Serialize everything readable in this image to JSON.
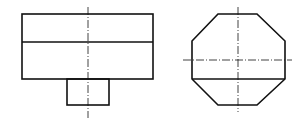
{
  "drawing": {
    "type": "orthographic projection",
    "views": [
      {
        "name": "front-view",
        "outer_rect": {
          "x": 22,
          "y": 14,
          "w": 131,
          "h": 65
        },
        "divider_y": 42,
        "stem_rect": {
          "x": 67,
          "y": 79,
          "w": 42,
          "h": 26
        },
        "centerline_v": {
          "x": 88,
          "y1": 7,
          "y2": 118
        }
      },
      {
        "name": "side-view",
        "octagon_points": "218,14 257,14 285,41 285,79 257,105 218,105 192,79 192,41",
        "chord": {
          "x1": 192,
          "x2": 285,
          "y": 79
        },
        "centerline_h": {
          "y": 60,
          "x1": 183,
          "x2": 292
        },
        "centerline_v": {
          "x": 238,
          "y1": 7,
          "y2": 112
        }
      }
    ],
    "colors": {
      "line": "#111111",
      "background": "#ffffff"
    }
  }
}
